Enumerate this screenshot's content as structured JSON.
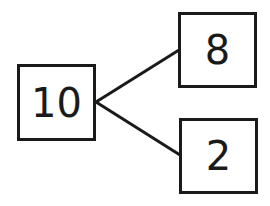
{
  "diagram": {
    "type": "number-bond",
    "whole": {
      "value": "10"
    },
    "parts": [
      {
        "value": "8"
      },
      {
        "value": "2"
      }
    ],
    "colors": {
      "stroke": "#1a1a1a",
      "background": "#ffffff"
    }
  }
}
